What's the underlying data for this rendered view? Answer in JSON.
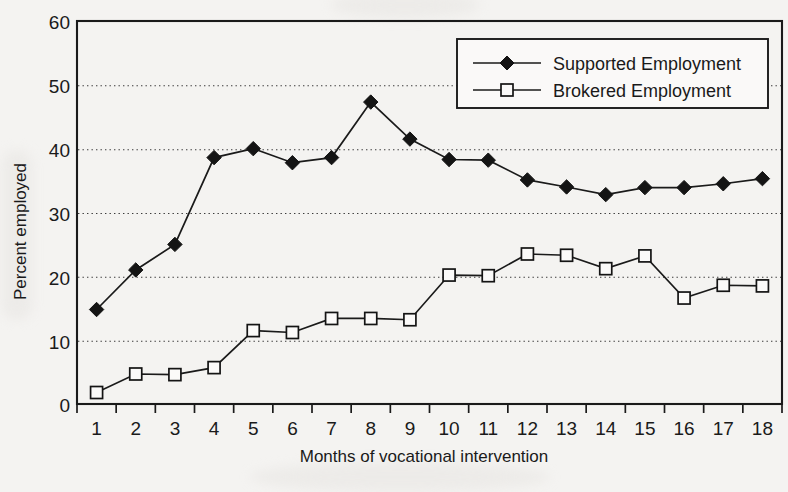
{
  "chart_data": {
    "type": "line",
    "title": "",
    "xlabel": "Months of vocational intervention",
    "ylabel": "Percent employed",
    "x": [
      1,
      2,
      3,
      4,
      5,
      6,
      7,
      8,
      9,
      10,
      11,
      12,
      13,
      14,
      15,
      16,
      17,
      18
    ],
    "categories": [
      "1",
      "2",
      "3",
      "4",
      "5",
      "6",
      "7",
      "8",
      "9",
      "10",
      "11",
      "12",
      "13",
      "14",
      "15",
      "16",
      "17",
      "18"
    ],
    "xlim": [
      1,
      18
    ],
    "ylim": [
      0,
      60
    ],
    "yticks": [
      0,
      10,
      20,
      30,
      40,
      50,
      60
    ],
    "ytick_labels": [
      "0",
      "10",
      "20",
      "30",
      "40",
      "50",
      "60"
    ],
    "grid": "horizontal-dotted",
    "legend_position": "top-right-inside",
    "series": [
      {
        "name": "Supported Employment",
        "marker": "filled-diamond",
        "values": [
          14.8,
          21.0,
          25.0,
          38.6,
          40.0,
          37.8,
          38.6,
          47.3,
          41.5,
          38.3,
          38.2,
          35.1,
          34.0,
          32.8,
          33.9,
          33.9,
          34.5,
          35.3
        ]
      },
      {
        "name": "Brokered Employment",
        "marker": "open-square",
        "values": [
          1.8,
          4.7,
          4.6,
          5.7,
          11.5,
          11.2,
          13.4,
          13.4,
          13.2,
          20.2,
          20.1,
          23.5,
          23.3,
          21.2,
          23.2,
          16.6,
          18.6,
          18.5
        ]
      }
    ]
  },
  "axes": {
    "y_title": "Percent employed",
    "x_title": "Months of vocational intervention",
    "y_tick_0": "0",
    "y_tick_10": "10",
    "y_tick_20": "20",
    "y_tick_30": "30",
    "y_tick_40": "40",
    "y_tick_50": "50",
    "y_tick_60": "60",
    "x_tick_1": "1",
    "x_tick_2": "2",
    "x_tick_3": "3",
    "x_tick_4": "4",
    "x_tick_5": "5",
    "x_tick_6": "6",
    "x_tick_7": "7",
    "x_tick_8": "8",
    "x_tick_9": "9",
    "x_tick_10": "10",
    "x_tick_11": "11",
    "x_tick_12": "12",
    "x_tick_13": "13",
    "x_tick_14": "14",
    "x_tick_15": "15",
    "x_tick_16": "16",
    "x_tick_17": "17",
    "x_tick_18": "18"
  },
  "legend": {
    "entries": [
      {
        "label": "Supported Employment",
        "marker": "filled-diamond"
      },
      {
        "label": "Brokered Employment",
        "marker": "open-square"
      }
    ]
  },
  "colors": {
    "ink": "#1a1a1a",
    "paper": "#f4f3f1",
    "marker_fill": "#141414",
    "marker_open_fill": "#fbfaf9"
  }
}
